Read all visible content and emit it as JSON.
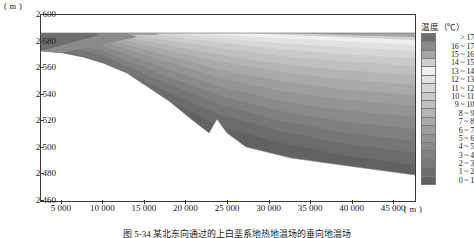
{
  "axes": {
    "y_unit": "( m )",
    "x_unit": "( m )",
    "y_ticks": [
      "2 600",
      "2 580",
      "2 560",
      "2 540",
      "2 520",
      "2 500",
      "2 480",
      "2 460"
    ],
    "x_ticks": [
      "5 000",
      "10 000",
      "15 000",
      "20 000",
      "25 000",
      "30 000",
      "35 000",
      "40 000",
      "45 000"
    ]
  },
  "legend": {
    "title": "温度（℃）",
    "entries": [
      {
        "label": "> 17",
        "color": "#6e6e6e"
      },
      {
        "label": "16 ~ 17",
        "color": "#8a8a8a"
      },
      {
        "label": "15 ~ 16",
        "color": "#a5a5a5"
      },
      {
        "label": "14 ~ 15",
        "color": "#cfcfcf"
      },
      {
        "label": "13 ~ 14",
        "color": "#efefef"
      },
      {
        "label": "12 ~ 13",
        "color": "#e2e2e2"
      },
      {
        "label": "11 ~ 12",
        "color": "#d6d6d6"
      },
      {
        "label": "10 ~ 11",
        "color": "#cacaca"
      },
      {
        "label": "9 ~ 10",
        "color": "#bfbfbf"
      },
      {
        "label": "8 ~ 9",
        "color": "#b4b4b4"
      },
      {
        "label": "7 ~ 8",
        "color": "#a9a9a9"
      },
      {
        "label": "6 ~ 7",
        "color": "#9e9e9e"
      },
      {
        "label": "5 ~ 6",
        "color": "#949494"
      },
      {
        "label": "4 ~ 5",
        "color": "#8a8a8a"
      },
      {
        "label": "3 ~ 4",
        "color": "#808080"
      },
      {
        "label": "2 ~ 3",
        "color": "#767676"
      },
      {
        "label": "1 ~ 2",
        "color": "#6c6c6c"
      },
      {
        "label": "0 ~ 1",
        "color": "#626262"
      }
    ]
  },
  "caption": "图 5-34   某北东向通过的上白垩系地热地温场的垂向地温场",
  "chart_data": {
    "type": "heatmap",
    "title": "温度（℃）",
    "xlabel": "( m )",
    "ylabel": "( m )",
    "xlim": [
      2500,
      47500
    ],
    "ylim": [
      2450,
      2605
    ],
    "grid": false,
    "legend_position": "right",
    "colorbar_label": "温度（℃）",
    "bands": [
      {
        "range": "> 17",
        "min": 17,
        "max": 18,
        "color": "#6e6e6e"
      },
      {
        "range": "16 ~ 17",
        "min": 16,
        "max": 17,
        "color": "#8a8a8a"
      },
      {
        "range": "15 ~ 16",
        "min": 15,
        "max": 16,
        "color": "#a5a5a5"
      },
      {
        "range": "14 ~ 15",
        "min": 14,
        "max": 15,
        "color": "#cfcfcf"
      },
      {
        "range": "13 ~ 14",
        "min": 13,
        "max": 14,
        "color": "#efefef"
      },
      {
        "range": "12 ~ 13",
        "min": 12,
        "max": 13,
        "color": "#e2e2e2"
      },
      {
        "range": "11 ~ 12",
        "min": 11,
        "max": 12,
        "color": "#d6d6d6"
      },
      {
        "range": "10 ~ 11",
        "min": 10,
        "max": 11,
        "color": "#cacaca"
      },
      {
        "range": "9 ~ 10",
        "min": 9,
        "max": 10,
        "color": "#bfbfbf"
      },
      {
        "range": "8 ~ 9",
        "min": 8,
        "max": 9,
        "color": "#b4b4b4"
      },
      {
        "range": "7 ~ 8",
        "min": 7,
        "max": 8,
        "color": "#a9a9a9"
      },
      {
        "range": "6 ~ 7",
        "min": 6,
        "max": 7,
        "color": "#9e9e9e"
      },
      {
        "range": "5 ~ 6",
        "min": 5,
        "max": 6,
        "color": "#949494"
      },
      {
        "range": "4 ~ 5",
        "min": 4,
        "max": 5,
        "color": "#8a8a8a"
      },
      {
        "range": "3 ~ 4",
        "min": 3,
        "max": 4,
        "color": "#808080"
      },
      {
        "range": "2 ~ 3",
        "min": 2,
        "max": 3,
        "color": "#767676"
      },
      {
        "range": "1 ~ 2",
        "min": 1,
        "max": 2,
        "color": "#6c6c6c"
      },
      {
        "range": "0 ~ 1",
        "min": 0,
        "max": 1,
        "color": "#626262"
      }
    ]
  }
}
